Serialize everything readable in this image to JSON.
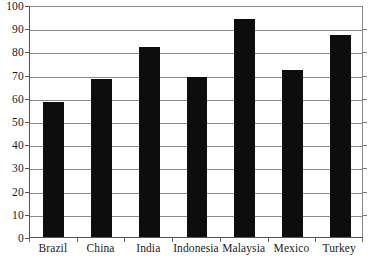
{
  "chart_data": {
    "type": "bar",
    "title": "",
    "xlabel": "",
    "ylabel": "",
    "categories": [
      "Brazil",
      "China",
      "India",
      "Indonesia",
      "Malaysia",
      "Mexico",
      "Turkey"
    ],
    "values": [
      58,
      68,
      82,
      69,
      94,
      72,
      87
    ],
    "ylim": [
      0,
      100
    ],
    "yticks": [
      0,
      10,
      20,
      30,
      40,
      50,
      60,
      70,
      80,
      90,
      100
    ],
    "ytick_labels": [
      "0",
      "10",
      "20",
      "30",
      "40",
      "50",
      "60",
      "70",
      "80",
      "90",
      "100"
    ],
    "grid": true,
    "grid_axis": "y",
    "legend": false,
    "legend_position": "none",
    "bar_color": "#0d0d0d",
    "axis_color": "#555555",
    "gridline_color": "#8a8a8a",
    "background_color": "#ffffff",
    "series": [
      {
        "name": "value",
        "values": [
          58,
          68,
          82,
          69,
          94,
          72,
          87
        ]
      }
    ]
  },
  "clipped_title_text": ""
}
